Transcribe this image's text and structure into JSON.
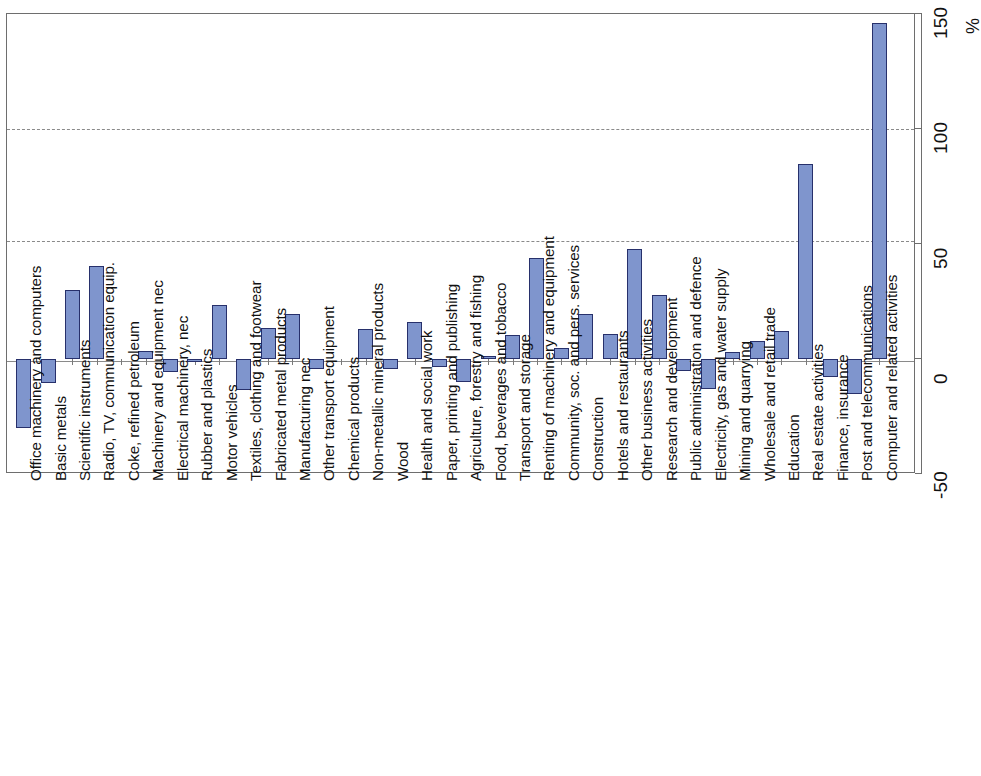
{
  "chart_data": {
    "type": "bar",
    "title": "",
    "subtitle": "",
    "xlabel": "",
    "ylabel": "%",
    "unit_label": "%",
    "ylim": [
      -50,
      150
    ],
    "y_ticks": [
      -50,
      0,
      50,
      100,
      150
    ],
    "y_tick_labels": [
      "-50",
      "0",
      "50",
      "100",
      "150"
    ],
    "gridlines": [
      50,
      100
    ],
    "grid": true,
    "legend": null,
    "orientation": "vertical-bars-rotated-labels",
    "bar_fill_color": "#7f95cd",
    "bar_border_color": "#27306b",
    "grid_color": "#8a8a8a",
    "axis_color": "#6e6e6e",
    "categories": [
      "Office machinery and computers",
      "Basic metals",
      "Scientific instruments",
      "Radio, TV, communication equip.",
      "Coke, refined petroleum",
      "Machinery and equipment nec",
      "Electrical machinery, nec",
      "Rubber and plastics",
      "Motor vehicles",
      "Textiles, clothing and footwear",
      "Fabricated metal products",
      "Manufacturing nec",
      "Other transport equipment",
      "Chemical products",
      "Non-metallic mineral products",
      "Wood",
      "Health and social work",
      "Paper, printing and publishing",
      "Agriculture, forestry and fishing",
      "Food, beverages and tobacco",
      "Transport and storage",
      "Renting of machinery and equipment",
      "Community, soc. and pers. services",
      "Construction",
      "Hotels and restaurants",
      "Other business activities",
      "Research and development",
      "Public administration and defence",
      "Electricity, gas and water supply",
      "Mining and quarrying",
      "Wholesale and retail trade",
      "Education",
      "Real estate activities",
      "Finance, insurance",
      "Post and telecommunications",
      "Computer and related activities"
    ],
    "values": [
      -30.0,
      -10.5,
      30.0,
      40.5,
      0.0,
      3.5,
      -5.5,
      -1.5,
      23.5,
      -13.5,
      13.5,
      19.5,
      -4.5,
      0.0,
      13.0,
      -4.5,
      16.0,
      -3.5,
      -10.0,
      1.5,
      10.5,
      44.0,
      5.0,
      19.5,
      11.0,
      48.0,
      28.0,
      -5.0,
      -13.0,
      3.0,
      8.0,
      12.0,
      85.0,
      -8.0,
      -15.0,
      146.0
    ]
  }
}
